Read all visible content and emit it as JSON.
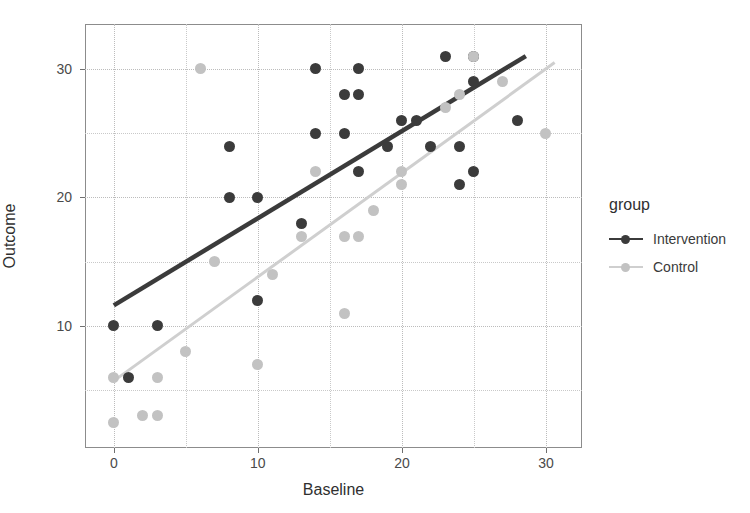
{
  "chart_data": {
    "type": "scatter",
    "title": "",
    "xlabel": "Baseline",
    "ylabel": "Outcome",
    "xlim": [
      -2.0,
      32.5
    ],
    "ylim": [
      0.5,
      33.5
    ],
    "xticks": [
      0,
      10,
      20,
      30
    ],
    "yticks": [
      10,
      20,
      30
    ],
    "xticklabels": [
      "0",
      "10",
      "20",
      "30"
    ],
    "yticklabels": [
      "10",
      "20",
      "30"
    ],
    "x_minor_gridlines": [
      5,
      15,
      25
    ],
    "y_minor_gridlines": [
      5,
      15,
      25
    ],
    "grid": true,
    "legend": {
      "title": "group",
      "position": "right",
      "entries": [
        {
          "name": "Intervention",
          "color": "#3b3b3b"
        },
        {
          "name": "Control",
          "color": "#c2c2c2"
        }
      ]
    },
    "series": [
      {
        "name": "Intervention",
        "color": "#3b3b3b",
        "marker": "circle",
        "points": [
          [
            0,
            10
          ],
          [
            1,
            6
          ],
          [
            3,
            10
          ],
          [
            8,
            24
          ],
          [
            8,
            20
          ],
          [
            10,
            12
          ],
          [
            10,
            20
          ],
          [
            13,
            18
          ],
          [
            14,
            30
          ],
          [
            14,
            25
          ],
          [
            16,
            25
          ],
          [
            16,
            28
          ],
          [
            17,
            30
          ],
          [
            17,
            28
          ],
          [
            17,
            22
          ],
          [
            19,
            24
          ],
          [
            20,
            26
          ],
          [
            21,
            26
          ],
          [
            22,
            24
          ],
          [
            23,
            31
          ],
          [
            24,
            21
          ],
          [
            24,
            24
          ],
          [
            25,
            29
          ],
          [
            25,
            31
          ],
          [
            25,
            22
          ],
          [
            28,
            26
          ]
        ],
        "fit_line": {
          "x0": 0.0,
          "y0": 11.6,
          "x1": 28.6,
          "y1": 31.0,
          "color": "#3b3b3b"
        }
      },
      {
        "name": "Control",
        "color": "#c2c2c2",
        "marker": "circle",
        "points": [
          [
            0,
            2.5
          ],
          [
            0,
            6
          ],
          [
            2,
            3
          ],
          [
            3,
            3
          ],
          [
            3,
            6
          ],
          [
            5,
            8
          ],
          [
            6,
            30
          ],
          [
            7,
            15
          ],
          [
            10,
            7
          ],
          [
            11,
            14
          ],
          [
            13,
            17
          ],
          [
            14,
            22
          ],
          [
            16,
            11
          ],
          [
            16,
            17
          ],
          [
            17,
            17
          ],
          [
            18,
            19
          ],
          [
            20,
            22
          ],
          [
            20,
            21
          ],
          [
            23,
            27
          ],
          [
            24,
            28
          ],
          [
            25,
            31
          ],
          [
            27,
            29
          ],
          [
            30,
            25
          ]
        ],
        "fit_line": {
          "x0": 0.1,
          "y0": 5.8,
          "x1": 30.6,
          "y1": 30.5,
          "color": "#cfcfcf"
        }
      }
    ]
  }
}
